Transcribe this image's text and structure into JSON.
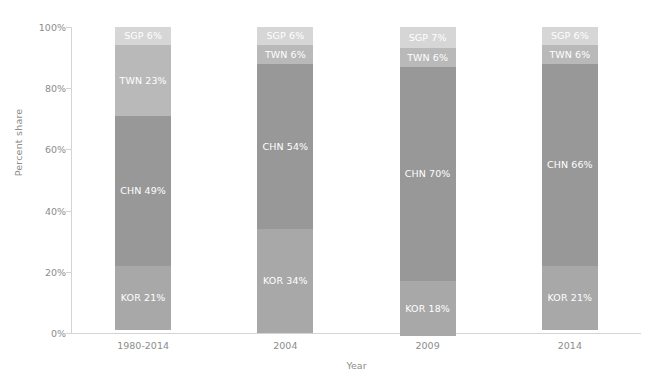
{
  "chart_data": {
    "type": "bar",
    "stacked": true,
    "normalized": true,
    "title": "",
    "xlabel": "Year",
    "ylabel": "Percent share",
    "categories": [
      "1980-2014",
      "2004",
      "2009",
      "2014"
    ],
    "ylim": [
      0,
      100
    ],
    "ytick_labels": [
      "0%",
      "20%",
      "40%",
      "60%",
      "80%",
      "100%"
    ],
    "ytick_values": [
      0,
      20,
      40,
      60,
      80,
      100
    ],
    "grid": false,
    "legend": false,
    "legend_position": "none",
    "series_order_bottom_to_top": [
      "KOR",
      "CHN",
      "TWN",
      "SGP"
    ],
    "series": [
      {
        "name": "KOR",
        "color": "#a8a8a8",
        "values": [
          21,
          34,
          18,
          21
        ],
        "labels": [
          "KOR 21%",
          "KOR 34%",
          "KOR 18%",
          "KOR 21%"
        ]
      },
      {
        "name": "CHN",
        "color": "#989898",
        "values": [
          49,
          54,
          70,
          66
        ],
        "labels": [
          "CHN 49%",
          "CHN 54%",
          "CHN 70%",
          "CHN 66%"
        ]
      },
      {
        "name": "TWN",
        "color": "#b9b9b9",
        "values": [
          23,
          6,
          6,
          6
        ],
        "labels": [
          "TWN 23%",
          "TWN 6%",
          "TWN 6%",
          "TWN 6%"
        ]
      },
      {
        "name": "SGP",
        "color": "#d6d6d6",
        "values": [
          6,
          6,
          7,
          6
        ],
        "labels": [
          "SGP 6%",
          "SGP 6%",
          "SGP 7%",
          "SGP 6%"
        ]
      }
    ],
    "label_text_color": "#ffffff",
    "axis_color": "#d4d4d4",
    "tick_text_color": "#8c8c8c",
    "background_color": "#ffffff"
  }
}
